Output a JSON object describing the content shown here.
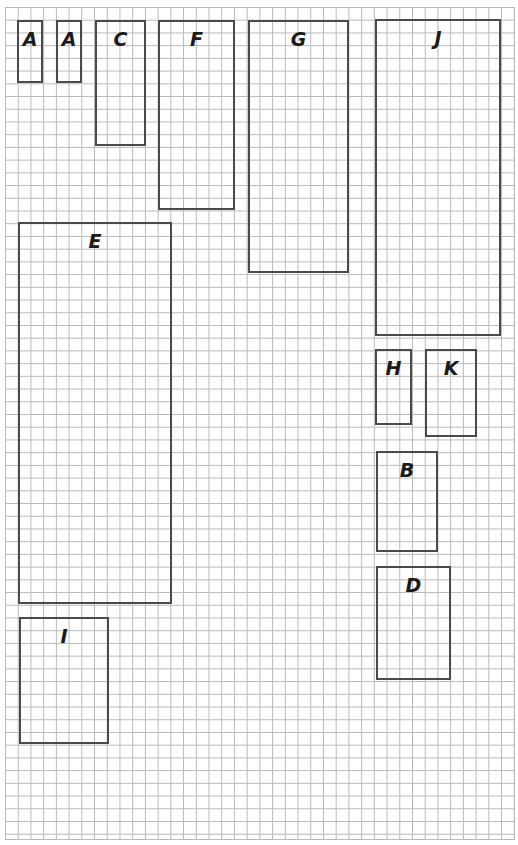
{
  "diagram": {
    "type": "grid-paper rectangles",
    "grid": {
      "left": 5,
      "top": 7,
      "cell_px": 12.72,
      "columns": 40,
      "rows": 65,
      "line_color": "#b9b9b9"
    },
    "border_color": "#4a4a4a",
    "rectangles": [
      {
        "label": "A",
        "x": 17,
        "y": 20,
        "w": 26,
        "h": 63
      },
      {
        "label": "A",
        "x": 56,
        "y": 20,
        "w": 26,
        "h": 63
      },
      {
        "label": "C",
        "x": 95,
        "y": 20,
        "w": 51,
        "h": 126
      },
      {
        "label": "F",
        "x": 158,
        "y": 20,
        "w": 77,
        "h": 190
      },
      {
        "label": "G",
        "x": 248,
        "y": 20,
        "w": 101,
        "h": 253
      },
      {
        "label": "J",
        "x": 375,
        "y": 19,
        "w": 126,
        "h": 317
      },
      {
        "label": "E",
        "x": 18,
        "y": 222,
        "w": 154,
        "h": 382
      },
      {
        "label": "H",
        "x": 375,
        "y": 349,
        "w": 37,
        "h": 76
      },
      {
        "label": "K",
        "x": 425,
        "y": 349,
        "w": 52,
        "h": 88
      },
      {
        "label": "B",
        "x": 376,
        "y": 451,
        "w": 62,
        "h": 101
      },
      {
        "label": "D",
        "x": 376,
        "y": 566,
        "w": 75,
        "h": 114
      },
      {
        "label": "I",
        "x": 19,
        "y": 617,
        "w": 90,
        "h": 127
      }
    ]
  }
}
